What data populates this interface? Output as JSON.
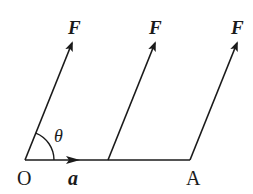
{
  "diagram": {
    "colors": {
      "stroke": "#1a1a1a",
      "background": "#ffffff"
    },
    "points": {
      "O": {
        "label": "O",
        "x": 25,
        "y": 160
      },
      "A": {
        "label": "A",
        "x": 190,
        "y": 160
      }
    },
    "displacement": {
      "label": "a",
      "from": "O",
      "to": "A"
    },
    "forces": [
      {
        "label": "F",
        "x1": 25,
        "y1": 160,
        "x2": 72,
        "y2": 42
      },
      {
        "label": "F",
        "x1": 108,
        "y1": 160,
        "x2": 155,
        "y2": 42
      },
      {
        "label": "F",
        "x1": 190,
        "y1": 160,
        "x2": 237,
        "y2": 42
      }
    ],
    "angle": {
      "label": "θ",
      "vertex": "O"
    }
  }
}
